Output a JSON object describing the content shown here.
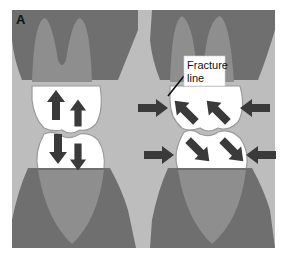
{
  "figure": {
    "panel_label": "A",
    "callout": {
      "line1": "Fracture",
      "line2": "line"
    },
    "colors": {
      "background": "#bdbdbd",
      "gum_dark": "#6f6f6f",
      "root_light": "#8e8e8e",
      "crown": "#ffffff",
      "crown_outline": "#9a9a9a",
      "arrow": "#3a3a3a",
      "page": "#ffffff"
    },
    "left_panel": {
      "description": "Vertical occlusal forces",
      "arrows": [
        "up",
        "up",
        "down",
        "down"
      ]
    },
    "right_panel": {
      "description": "Lateral / oblique forces causing fracture",
      "arrows": [
        "right",
        "up-left",
        "up-left",
        "left",
        "right",
        "down-right",
        "down-right",
        "left"
      ]
    }
  }
}
